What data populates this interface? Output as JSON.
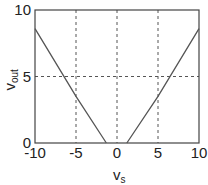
{
  "chart_data": {
    "type": "line",
    "title": "",
    "xlabel": "v",
    "xlabel_sub": "s",
    "ylabel": "v",
    "ylabel_sub": "out",
    "xlim": [
      -10,
      10
    ],
    "ylim": [
      0,
      10
    ],
    "xticks": [
      -10,
      -5,
      0,
      5,
      10
    ],
    "yticks": [
      0,
      5,
      10
    ],
    "xtick_labels": [
      "-10",
      "-5",
      "0",
      "5",
      "10"
    ],
    "ytick_labels": [
      "0",
      "5",
      "10"
    ],
    "grid": true,
    "grid_style": "dashed",
    "series": [
      {
        "name": "vout",
        "color": "#555555",
        "x": [
          -10,
          -5,
          -1.3,
          1.2,
          5,
          10
        ],
        "y": [
          8.6,
          3.5,
          0,
          0,
          3.5,
          8.6
        ]
      }
    ]
  }
}
